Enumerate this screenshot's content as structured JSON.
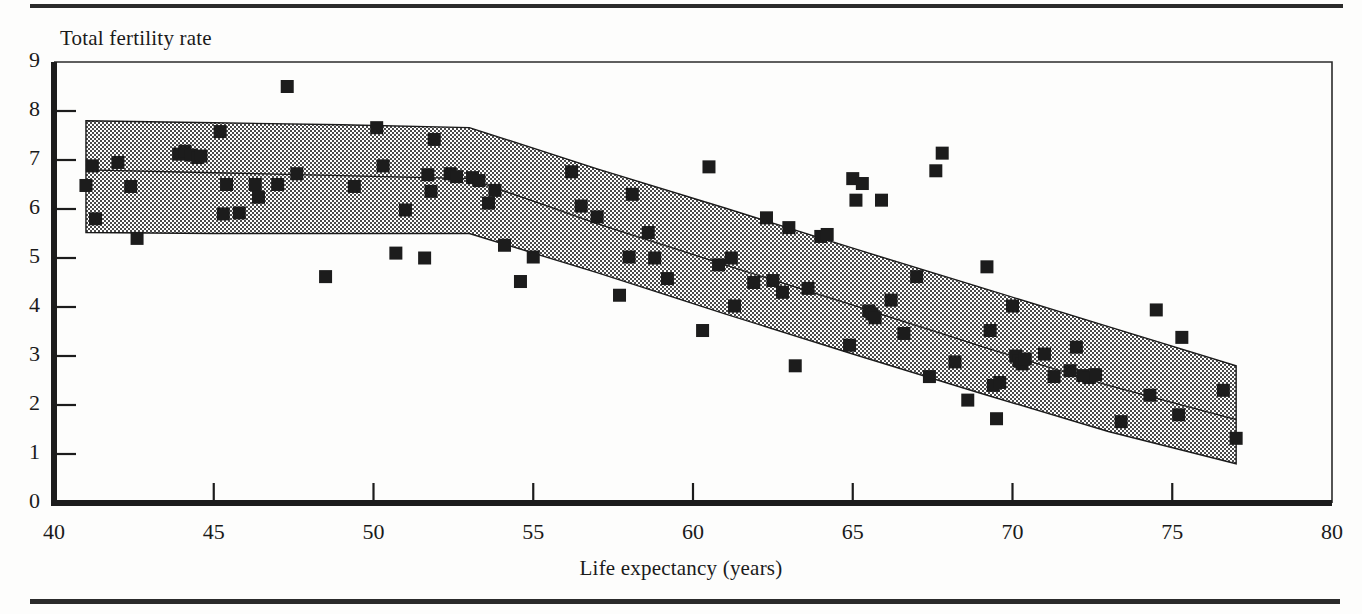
{
  "figure": {
    "y_axis_title": "Total fertility rate",
    "x_axis_title": "Life expectancy (years)",
    "top_rule": "horizontal-rule",
    "bottom_rule": "horizontal-rule"
  },
  "chart_data": {
    "type": "scatter",
    "title": "",
    "xlabel": "Life expectancy (years)",
    "ylabel": "Total fertility rate",
    "xlim": [
      40,
      80
    ],
    "ylim": [
      0,
      9
    ],
    "xticks": [
      40,
      45,
      50,
      55,
      60,
      65,
      70,
      75,
      80
    ],
    "yticks": [
      0,
      1,
      2,
      3,
      4,
      5,
      6,
      7,
      8,
      9
    ],
    "grid": false,
    "legend": "none",
    "marker": "filled-square",
    "marker_color": "#1c1c1c",
    "band_fill": "#b8b8b8",
    "band_label": "confidence-band",
    "annotations": [],
    "points": [
      [
        41.0,
        6.48
      ],
      [
        41.2,
        6.88
      ],
      [
        41.3,
        5.8
      ],
      [
        42.0,
        6.95
      ],
      [
        42.4,
        6.46
      ],
      [
        42.6,
        5.4
      ],
      [
        43.9,
        7.12
      ],
      [
        44.1,
        7.18
      ],
      [
        44.3,
        7.1
      ],
      [
        44.5,
        7.05
      ],
      [
        44.6,
        7.08
      ],
      [
        45.2,
        7.58
      ],
      [
        45.3,
        5.9
      ],
      [
        45.4,
        6.5
      ],
      [
        45.8,
        5.92
      ],
      [
        46.3,
        6.5
      ],
      [
        46.4,
        6.24
      ],
      [
        47.0,
        6.5
      ],
      [
        47.3,
        8.5
      ],
      [
        47.6,
        6.72
      ],
      [
        48.5,
        4.62
      ],
      [
        49.4,
        6.46
      ],
      [
        50.1,
        7.66
      ],
      [
        50.3,
        6.88
      ],
      [
        50.7,
        5.1
      ],
      [
        51.0,
        5.98
      ],
      [
        51.6,
        5.0
      ],
      [
        51.7,
        6.7
      ],
      [
        51.8,
        6.36
      ],
      [
        51.9,
        7.42
      ],
      [
        52.4,
        6.72
      ],
      [
        52.6,
        6.66
      ],
      [
        53.1,
        6.64
      ],
      [
        53.3,
        6.58
      ],
      [
        53.6,
        6.12
      ],
      [
        53.8,
        6.38
      ],
      [
        54.1,
        5.26
      ],
      [
        54.6,
        4.52
      ],
      [
        55.0,
        5.02
      ],
      [
        56.2,
        6.76
      ],
      [
        56.5,
        6.06
      ],
      [
        57.0,
        5.84
      ],
      [
        57.7,
        4.24
      ],
      [
        58.0,
        5.02
      ],
      [
        58.1,
        6.3
      ],
      [
        58.6,
        5.52
      ],
      [
        58.8,
        5.0
      ],
      [
        59.2,
        4.58
      ],
      [
        60.3,
        3.52
      ],
      [
        60.5,
        6.86
      ],
      [
        60.8,
        4.86
      ],
      [
        61.2,
        5.0
      ],
      [
        61.3,
        4.02
      ],
      [
        61.9,
        4.5
      ],
      [
        62.3,
        5.82
      ],
      [
        62.5,
        4.54
      ],
      [
        62.8,
        4.3
      ],
      [
        63.0,
        5.62
      ],
      [
        63.2,
        2.8
      ],
      [
        63.6,
        4.38
      ],
      [
        64.0,
        5.44
      ],
      [
        64.2,
        5.48
      ],
      [
        64.9,
        3.22
      ],
      [
        65.0,
        6.62
      ],
      [
        65.1,
        6.18
      ],
      [
        65.3,
        6.52
      ],
      [
        65.5,
        3.92
      ],
      [
        65.6,
        3.86
      ],
      [
        65.7,
        3.78
      ],
      [
        65.9,
        6.18
      ],
      [
        66.2,
        4.14
      ],
      [
        66.6,
        3.46
      ],
      [
        67.0,
        4.62
      ],
      [
        67.4,
        2.58
      ],
      [
        67.6,
        6.78
      ],
      [
        67.8,
        7.14
      ],
      [
        68.2,
        2.88
      ],
      [
        68.6,
        2.1
      ],
      [
        69.2,
        4.82
      ],
      [
        69.3,
        3.52
      ],
      [
        69.4,
        2.4
      ],
      [
        69.5,
        1.72
      ],
      [
        69.6,
        2.46
      ],
      [
        70.0,
        4.02
      ],
      [
        70.1,
        3.0
      ],
      [
        70.2,
        2.9
      ],
      [
        70.3,
        2.84
      ],
      [
        70.4,
        2.94
      ],
      [
        71.0,
        3.04
      ],
      [
        71.3,
        2.58
      ],
      [
        71.8,
        2.7
      ],
      [
        72.0,
        3.18
      ],
      [
        72.2,
        2.6
      ],
      [
        72.4,
        2.56
      ],
      [
        72.6,
        2.62
      ],
      [
        73.4,
        1.66
      ],
      [
        74.3,
        2.2
      ],
      [
        74.5,
        3.94
      ],
      [
        75.2,
        1.8
      ],
      [
        75.3,
        3.38
      ],
      [
        76.6,
        2.3
      ],
      [
        77.0,
        1.32
      ]
    ],
    "fit_line": [
      [
        41.0,
        6.8
      ],
      [
        45.0,
        6.74
      ],
      [
        49.0,
        6.68
      ],
      [
        53.0,
        6.62
      ],
      [
        57.0,
        5.7
      ],
      [
        61.0,
        4.86
      ],
      [
        65.0,
        4.04
      ],
      [
        69.0,
        3.2
      ],
      [
        73.0,
        2.4
      ],
      [
        77.0,
        1.7
      ]
    ],
    "band_upper": [
      [
        41.0,
        7.8
      ],
      [
        45.0,
        7.76
      ],
      [
        49.0,
        7.72
      ],
      [
        53.0,
        7.66
      ],
      [
        57.0,
        6.82
      ],
      [
        61.0,
        6.02
      ],
      [
        65.0,
        5.2
      ],
      [
        69.0,
        4.4
      ],
      [
        73.0,
        3.6
      ],
      [
        77.0,
        2.8
      ]
    ],
    "band_lower": [
      [
        41.0,
        5.52
      ],
      [
        45.0,
        5.5
      ],
      [
        49.0,
        5.5
      ],
      [
        53.0,
        5.5
      ],
      [
        57.0,
        4.7
      ],
      [
        61.0,
        3.86
      ],
      [
        65.0,
        3.04
      ],
      [
        69.0,
        2.24
      ],
      [
        73.0,
        1.46
      ],
      [
        77.0,
        0.8
      ]
    ]
  }
}
